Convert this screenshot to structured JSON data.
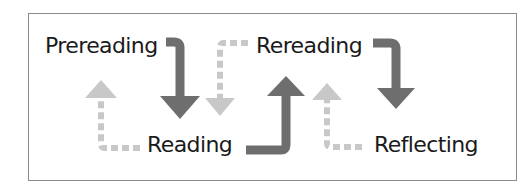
{
  "diagram": {
    "type": "process-cycle",
    "stages": [
      {
        "id": "prereading",
        "label": "Prereading"
      },
      {
        "id": "reading",
        "label": "Reading"
      },
      {
        "id": "rereading",
        "label": "Rereading"
      },
      {
        "id": "reflecting",
        "label": "Reflecting"
      }
    ],
    "arrows": [
      {
        "from": "Prereading",
        "to": "Reading",
        "style": "solid-dark"
      },
      {
        "from": "Reading",
        "to": "Prereading",
        "style": "dashed-light"
      },
      {
        "from": "Reading",
        "to": "Rereading",
        "style": "solid-dark"
      },
      {
        "from": "Rereading",
        "to": "Reading",
        "style": "dashed-light"
      },
      {
        "from": "Rereading",
        "to": "Reflecting",
        "style": "solid-dark"
      },
      {
        "from": "Reflecting",
        "to": "Rereading",
        "style": "dashed-light"
      }
    ],
    "colors": {
      "dark_arrow": "#6e6e6e",
      "light_arrow": "#c8c8c8",
      "text": "#1a1a1a",
      "border": "#8c8c8c"
    }
  }
}
